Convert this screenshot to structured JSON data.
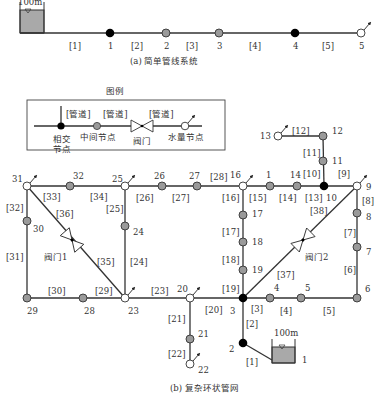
{
  "colors": {
    "line": "#333333",
    "junction_node": "#000000",
    "intermediate_node": "#9a9a9a",
    "demand_node": "#ffffff",
    "tank_fill": "#a9a9a9",
    "background": "#ffffff"
  },
  "simple_system": {
    "caption": "(a) 简单管线系统",
    "tank_label": "100m",
    "nodes": [
      {
        "id": "1",
        "type": "junction",
        "x": 110,
        "y": 33
      },
      {
        "id": "2",
        "type": "intermediate",
        "x": 166,
        "y": 33
      },
      {
        "id": "3",
        "type": "intermediate",
        "x": 219,
        "y": 33
      },
      {
        "id": "4",
        "type": "junction",
        "x": 295,
        "y": 33
      },
      {
        "id": "5",
        "type": "demand",
        "x": 361,
        "y": 33
      }
    ],
    "pipes": [
      {
        "id": "[1]",
        "lx": 75,
        "ly": 48
      },
      {
        "id": "[2]",
        "lx": 137,
        "ly": 48
      },
      {
        "id": "[3]",
        "lx": 192,
        "ly": 48
      },
      {
        "id": "[4]",
        "lx": 255,
        "ly": 48
      },
      {
        "id": "[5]",
        "lx": 328,
        "ly": 48
      }
    ]
  },
  "legend": {
    "title": "图例",
    "pipe_label": "[管道]",
    "junction_label_line1": "相交",
    "junction_label_line2": "节点",
    "intermediate_label": "中间节点",
    "valve_label": "阀门",
    "demand_label": "水量节点"
  },
  "complex_network": {
    "caption": "(b) 复杂环状管网",
    "tank_label": "100m",
    "tank_node_label": "1",
    "valves": [
      {
        "label": "阀门1",
        "x": 72,
        "y": 240
      },
      {
        "label": "阀门2",
        "x": 303,
        "y": 241
      }
    ],
    "nodes": [
      {
        "id": "31",
        "type": "demand",
        "x": 27,
        "y": 186,
        "lx": 12,
        "ly": 182
      },
      {
        "id": "32",
        "type": "intermediate",
        "x": 70,
        "y": 186,
        "lx": 73,
        "ly": 179
      },
      {
        "id": "25",
        "type": "demand",
        "x": 125,
        "y": 186,
        "lx": 112,
        "ly": 182
      },
      {
        "id": "26",
        "type": "intermediate",
        "x": 162,
        "y": 186,
        "lx": 154,
        "ly": 179
      },
      {
        "id": "27",
        "type": "intermediate",
        "x": 197,
        "y": 186,
        "lx": 189,
        "ly": 179
      },
      {
        "id": "16",
        "type": "demand",
        "x": 243,
        "y": 186,
        "lx": 230,
        "ly": 178
      },
      {
        "id": "1",
        "type": "intermediate",
        "x": 270,
        "y": 186,
        "lx": 266,
        "ly": 178
      },
      {
        "id": "14",
        "type": "intermediate",
        "x": 297,
        "y": 186,
        "lx": 290,
        "ly": 178
      },
      {
        "id": "10",
        "type": "junction",
        "x": 324,
        "y": 186,
        "lx": 326,
        "ly": 201
      },
      {
        "id": "9",
        "type": "demand",
        "x": 357,
        "y": 186,
        "lx": 366,
        "ly": 190
      },
      {
        "id": "13",
        "type": "demand",
        "x": 278,
        "y": 136,
        "lx": 260,
        "ly": 139
      },
      {
        "id": "12",
        "type": "intermediate",
        "x": 323,
        "y": 136,
        "lx": 332,
        "ly": 134
      },
      {
        "id": "11",
        "type": "intermediate",
        "x": 323,
        "y": 161,
        "lx": 332,
        "ly": 164
      },
      {
        "id": "17",
        "type": "intermediate",
        "x": 243,
        "y": 215,
        "lx": 252,
        "ly": 217
      },
      {
        "id": "18",
        "type": "intermediate",
        "x": 243,
        "y": 242,
        "lx": 252,
        "ly": 245
      },
      {
        "id": "19",
        "type": "intermediate",
        "x": 243,
        "y": 270,
        "lx": 252,
        "ly": 273
      },
      {
        "id": "3",
        "type": "junction",
        "x": 243,
        "y": 298,
        "lx": 230,
        "ly": 314
      },
      {
        "id": "8",
        "type": "intermediate",
        "x": 357,
        "y": 213,
        "lx": 366,
        "ly": 220
      },
      {
        "id": "7",
        "type": "intermediate",
        "x": 357,
        "y": 247,
        "lx": 366,
        "ly": 255
      },
      {
        "id": "6",
        "type": "intermediate",
        "x": 357,
        "y": 298,
        "lx": 365,
        "ly": 292
      },
      {
        "id": "4",
        "type": "intermediate",
        "x": 270,
        "y": 298,
        "lx": 274,
        "ly": 291
      },
      {
        "id": "5",
        "type": "intermediate",
        "x": 301,
        "y": 298,
        "lx": 305,
        "ly": 291
      },
      {
        "id": "30",
        "type": "intermediate",
        "x": 27,
        "y": 221,
        "lx": 33,
        "ly": 232
      },
      {
        "id": "24",
        "type": "intermediate",
        "x": 125,
        "y": 226,
        "lx": 133,
        "ly": 235
      },
      {
        "id": "29",
        "type": "intermediate",
        "x": 27,
        "y": 298,
        "lx": 27,
        "ly": 314
      },
      {
        "id": "28",
        "type": "intermediate",
        "x": 83,
        "y": 298,
        "lx": 84,
        "ly": 314
      },
      {
        "id": "23",
        "type": "demand",
        "x": 125,
        "y": 298,
        "lx": 128,
        "ly": 314
      },
      {
        "id": "20",
        "type": "demand",
        "x": 190,
        "y": 298,
        "lx": 177,
        "ly": 292
      },
      {
        "id": "21",
        "type": "intermediate",
        "x": 190,
        "y": 339,
        "lx": 198,
        "ly": 337
      },
      {
        "id": "22",
        "type": "demand",
        "x": 190,
        "y": 364,
        "lx": 198,
        "ly": 373
      },
      {
        "id": "2",
        "type": "junction",
        "x": 243,
        "y": 343,
        "lx": 229,
        "ly": 352
      }
    ],
    "pipe_labels": [
      {
        "id": "[32]",
        "x": 6,
        "y": 211
      },
      {
        "id": "[33]",
        "x": 43,
        "y": 200
      },
      {
        "id": "[34]",
        "x": 90,
        "y": 200
      },
      {
        "id": "[36]",
        "x": 56,
        "y": 217
      },
      {
        "id": "[25]",
        "x": 106,
        "y": 212
      },
      {
        "id": "[26]",
        "x": 136,
        "y": 201
      },
      {
        "id": "[27]",
        "x": 172,
        "y": 201
      },
      {
        "id": "[28]",
        "x": 210,
        "y": 180
      },
      {
        "id": "[16]",
        "x": 222,
        "y": 201
      },
      {
        "id": "[15]",
        "x": 249,
        "y": 201
      },
      {
        "id": "[14]",
        "x": 279,
        "y": 201
      },
      {
        "id": "[13]",
        "x": 305,
        "y": 201
      },
      {
        "id": "[10]",
        "x": 303,
        "y": 177
      },
      {
        "id": "[9]",
        "x": 338,
        "y": 177
      },
      {
        "id": "[12]",
        "x": 292,
        "y": 134
      },
      {
        "id": "[11]",
        "x": 303,
        "y": 156
      },
      {
        "id": "[8]",
        "x": 362,
        "y": 204
      },
      {
        "id": "[38]",
        "x": 310,
        "y": 214
      },
      {
        "id": "[7]",
        "x": 344,
        "y": 236
      },
      {
        "id": "[6]",
        "x": 344,
        "y": 273
      },
      {
        "id": "[37]",
        "x": 277,
        "y": 278
      },
      {
        "id": "[17]",
        "x": 222,
        "y": 235
      },
      {
        "id": "[18]",
        "x": 222,
        "y": 263
      },
      {
        "id": "[19]",
        "x": 222,
        "y": 292
      },
      {
        "id": "[24]",
        "x": 130,
        "y": 265
      },
      {
        "id": "[35]",
        "x": 97,
        "y": 265
      },
      {
        "id": "[31]",
        "x": 6,
        "y": 260
      },
      {
        "id": "[30]",
        "x": 48,
        "y": 294
      },
      {
        "id": "[29]",
        "x": 95,
        "y": 294
      },
      {
        "id": "[23]",
        "x": 151,
        "y": 294
      },
      {
        "id": "[20]",
        "x": 205,
        "y": 313
      },
      {
        "id": "[3]",
        "x": 251,
        "y": 312
      },
      {
        "id": "[4]",
        "x": 280,
        "y": 314
      },
      {
        "id": "[5]",
        "x": 323,
        "y": 314
      },
      {
        "id": "[2]",
        "x": 246,
        "y": 327
      },
      {
        "id": "[1]",
        "x": 246,
        "y": 365
      },
      {
        "id": "[21]",
        "x": 168,
        "y": 322
      },
      {
        "id": "[22]",
        "x": 168,
        "y": 357
      }
    ]
  }
}
